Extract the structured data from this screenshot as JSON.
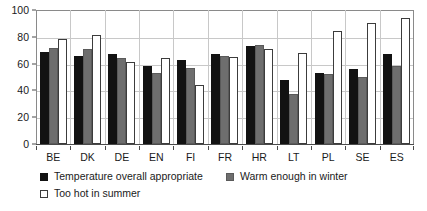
{
  "chart_data": {
    "type": "bar",
    "title": "",
    "xlabel": "",
    "ylabel": "",
    "ylim": [
      0,
      100
    ],
    "yticks": [
      0,
      20,
      40,
      60,
      80,
      100
    ],
    "grid": true,
    "legend_position": "bottom-left",
    "categories": [
      "BE",
      "DK",
      "DE",
      "EN",
      "FI",
      "FR",
      "HR",
      "LT",
      "PL",
      "SE",
      "ES"
    ],
    "series": [
      {
        "name": "Temperature overall appropriate",
        "color": "#121212",
        "values": [
          69,
          66,
          67,
          58,
          63,
          67,
          73,
          48,
          53,
          56,
          67
        ]
      },
      {
        "name": "Warm enough in winter",
        "color": "#6e6e6e",
        "values": [
          72,
          71,
          64,
          53,
          57,
          66,
          74,
          37,
          52,
          50,
          58
        ]
      },
      {
        "name": "Too hot in summer",
        "color": "#ffffff",
        "values": [
          78,
          81,
          61,
          64,
          44,
          65,
          71,
          68,
          84,
          90,
          94
        ]
      }
    ]
  },
  "axes": {
    "y_tick_labels": [
      "0",
      "20",
      "40",
      "60",
      "80",
      "100"
    ]
  },
  "legend": {
    "items": [
      {
        "label": "Temperature overall appropriate",
        "swatch": "black-square-swatch"
      },
      {
        "label": "Warm enough in winter",
        "swatch": "gray-square-swatch"
      },
      {
        "label": "Too hot in summer",
        "swatch": "white-square-swatch"
      }
    ]
  }
}
